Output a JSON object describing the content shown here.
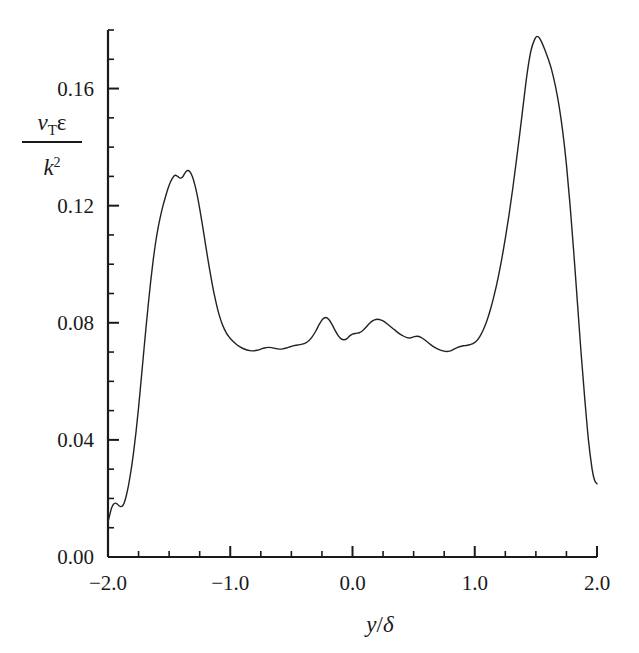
{
  "chart_data": {
    "type": "line",
    "title": "",
    "xlabel": "y/δ",
    "ylabel_numerator": "νTε",
    "ylabel_denominator": "k²",
    "ylabel": "νTε / k²",
    "xlim": [
      -2.0,
      2.0
    ],
    "ylim": [
      0.0,
      0.18
    ],
    "grid": false,
    "legend": null,
    "x_major_ticks": [
      -2.0,
      -1.0,
      0.0,
      1.0,
      2.0
    ],
    "x_tick_labels": [
      "-2.0",
      "-1.0",
      "0.0",
      "1.0",
      "2.0"
    ],
    "x_minor_step": 0.25,
    "y_major_ticks": [
      0.0,
      0.04,
      0.08,
      0.12,
      0.16
    ],
    "y_tick_labels": [
      "0.00",
      "0.04",
      "0.08",
      "0.12",
      "0.16"
    ],
    "y_minor_step": 0.01,
    "line_color": "#222222",
    "line_width": 1.4,
    "series": [
      {
        "name": "eddy-viscosity-ratio",
        "x": [
          -2.0,
          -1.985,
          -1.97,
          -1.955,
          -1.94,
          -1.925,
          -1.91,
          -1.895,
          -1.88,
          -1.865,
          -1.85,
          -1.83,
          -1.81,
          -1.79,
          -1.77,
          -1.75,
          -1.73,
          -1.71,
          -1.69,
          -1.67,
          -1.65,
          -1.63,
          -1.61,
          -1.59,
          -1.57,
          -1.55,
          -1.53,
          -1.51,
          -1.49,
          -1.47,
          -1.45,
          -1.43,
          -1.41,
          -1.39,
          -1.37,
          -1.35,
          -1.33,
          -1.31,
          -1.29,
          -1.27,
          -1.25,
          -1.23,
          -1.21,
          -1.19,
          -1.17,
          -1.15,
          -1.13,
          -1.11,
          -1.09,
          -1.07,
          -1.05,
          -1.03,
          -1.01,
          -0.99,
          -0.96,
          -0.93,
          -0.9,
          -0.87,
          -0.84,
          -0.81,
          -0.78,
          -0.75,
          -0.72,
          -0.69,
          -0.66,
          -0.63,
          -0.6,
          -0.57,
          -0.54,
          -0.51,
          -0.48,
          -0.45,
          -0.42,
          -0.39,
          -0.36,
          -0.33,
          -0.3,
          -0.27,
          -0.245,
          -0.22,
          -0.195,
          -0.17,
          -0.145,
          -0.12,
          -0.095,
          -0.07,
          -0.045,
          -0.02,
          0.005,
          0.03,
          0.055,
          0.08,
          0.105,
          0.13,
          0.155,
          0.18,
          0.205,
          0.23,
          0.26,
          0.29,
          0.32,
          0.35,
          0.38,
          0.41,
          0.44,
          0.47,
          0.5,
          0.53,
          0.56,
          0.59,
          0.62,
          0.65,
          0.68,
          0.71,
          0.74,
          0.77,
          0.8,
          0.83,
          0.86,
          0.89,
          0.92,
          0.95,
          0.98,
          1.01,
          1.04,
          1.07,
          1.1,
          1.13,
          1.16,
          1.19,
          1.22,
          1.25,
          1.28,
          1.31,
          1.34,
          1.37,
          1.4,
          1.43,
          1.46,
          1.49,
          1.51,
          1.53,
          1.55,
          1.57,
          1.59,
          1.61,
          1.63,
          1.66,
          1.69,
          1.72,
          1.75,
          1.78,
          1.81,
          1.84,
          1.87,
          1.9,
          1.93,
          1.96,
          1.98,
          2.0
        ],
        "y": [
          0.012,
          0.0145,
          0.0168,
          0.018,
          0.0184,
          0.0181,
          0.0175,
          0.0172,
          0.0175,
          0.0188,
          0.021,
          0.025,
          0.03,
          0.036,
          0.043,
          0.051,
          0.06,
          0.069,
          0.078,
          0.0865,
          0.0945,
          0.1015,
          0.1075,
          0.1125,
          0.1165,
          0.12,
          0.123,
          0.1258,
          0.128,
          0.1296,
          0.1304,
          0.13,
          0.1294,
          0.1298,
          0.1312,
          0.132,
          0.1316,
          0.13,
          0.1272,
          0.1235,
          0.119,
          0.114,
          0.1088,
          0.1035,
          0.0985,
          0.0938,
          0.0895,
          0.0858,
          0.0826,
          0.08,
          0.078,
          0.0764,
          0.0752,
          0.0742,
          0.073,
          0.072,
          0.0713,
          0.0708,
          0.0705,
          0.0704,
          0.0706,
          0.071,
          0.0714,
          0.0716,
          0.0715,
          0.0712,
          0.071,
          0.0711,
          0.0714,
          0.0718,
          0.0722,
          0.0724,
          0.0726,
          0.073,
          0.0738,
          0.0752,
          0.0772,
          0.0796,
          0.0812,
          0.0818,
          0.0812,
          0.0796,
          0.0776,
          0.0758,
          0.0746,
          0.0742,
          0.0746,
          0.0756,
          0.0762,
          0.0764,
          0.0766,
          0.0772,
          0.0782,
          0.0794,
          0.0804,
          0.081,
          0.0812,
          0.081,
          0.0804,
          0.0794,
          0.0784,
          0.0774,
          0.0764,
          0.0756,
          0.075,
          0.0748,
          0.0752,
          0.0754,
          0.075,
          0.0742,
          0.0732,
          0.0722,
          0.0714,
          0.0708,
          0.0704,
          0.0702,
          0.0704,
          0.071,
          0.0716,
          0.072,
          0.0722,
          0.0724,
          0.0728,
          0.0736,
          0.0752,
          0.0776,
          0.0808,
          0.0848,
          0.0896,
          0.0952,
          0.1016,
          0.1088,
          0.1168,
          0.1256,
          0.1352,
          0.1452,
          0.1556,
          0.1656,
          0.173,
          0.1768,
          0.1778,
          0.1772,
          0.1756,
          0.1736,
          0.1714,
          0.169,
          0.1662,
          0.1608,
          0.154,
          0.1452,
          0.134,
          0.12,
          0.104,
          0.0868,
          0.0696,
          0.054,
          0.04,
          0.03,
          0.0262,
          0.025
        ]
      }
    ]
  },
  "axes": {
    "plot_left_px": 108,
    "plot_right_px": 597,
    "plot_bottom_px": 557,
    "plot_top_px": 30
  }
}
